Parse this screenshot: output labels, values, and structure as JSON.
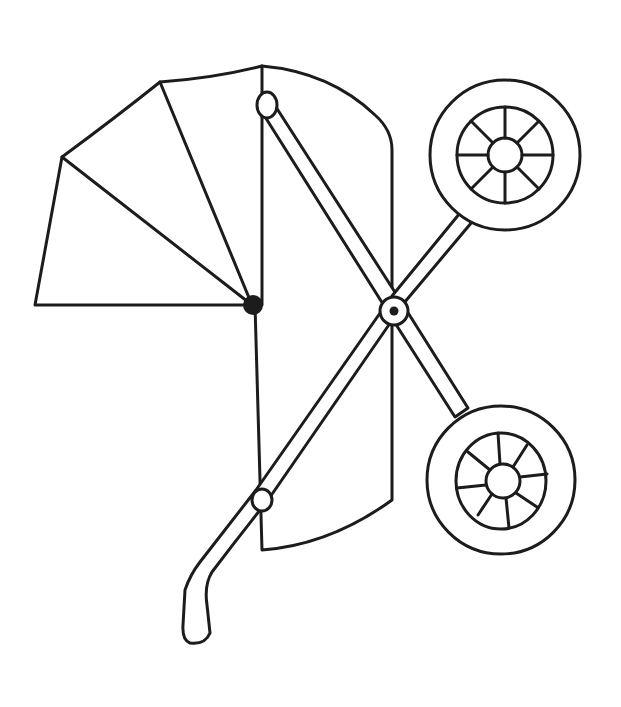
{
  "illustration": {
    "subject": "baby stroller line drawing",
    "background": "#ffffff",
    "stroke_color": "#1c1c1c",
    "parts": [
      "canopy-hood",
      "bassinet-body",
      "front-frame-bar",
      "rear-frame-bar",
      "handle",
      "top-wheel",
      "bottom-wheel",
      "pivot-joint",
      "hood-hinge"
    ]
  }
}
